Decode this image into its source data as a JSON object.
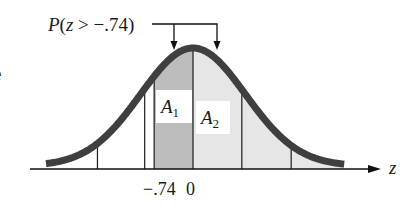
{
  "figure": {
    "title_label": {
      "prefix": "P",
      "open": "(",
      "variable": "z",
      "relation": " > ",
      "value": "−.74",
      "close": ")"
    },
    "margin_fragment": "e",
    "axis": {
      "variable_label": "z",
      "tick_labels": [
        {
          "text": "−.74",
          "z": -0.74
        },
        {
          "text": "0",
          "z": 0
        }
      ]
    },
    "regions": {
      "A1": {
        "symbol": "A",
        "subscript": "1",
        "from_z": -0.74,
        "to_z": 0,
        "shade": "#bdbdbd"
      },
      "A2": {
        "symbol": "A",
        "subscript": "2",
        "from_z": 0,
        "to_z": 3,
        "shade": "#e4e4e4"
      }
    },
    "vertical_lines_z": [
      -1.82,
      -0.92,
      -0.74,
      0,
      0.93,
      1.87
    ],
    "colors": {
      "curve": "#3f3f3f",
      "axis": "#111111",
      "dark_shade": "#bdbdbd",
      "light_shade": "#e6e6e6",
      "label_box": "#ffffff"
    }
  },
  "chart_data": {
    "type": "area",
    "title": "P(z > −.74)",
    "xlabel": "z",
    "ylabel": "",
    "distribution": "standard normal",
    "shaded_regions": [
      {
        "name": "A1",
        "from": -0.74,
        "to": 0
      },
      {
        "name": "A2",
        "from": 0,
        "to": "+∞"
      }
    ],
    "tick_labels": [
      "−.74",
      "0"
    ],
    "xlim": [
      -2.9,
      2.9
    ],
    "grid": false,
    "annotation": "P(z > −.74) = A1 + A2"
  }
}
